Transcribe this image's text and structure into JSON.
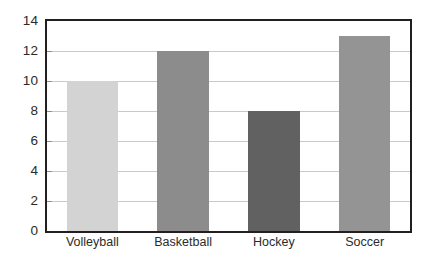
{
  "chart_data": {
    "type": "bar",
    "title": "",
    "subtitle": "",
    "xlabel": "",
    "ylabel": "",
    "categories": [
      "Volleyball",
      "Basketball",
      "Hockey",
      "Soccer"
    ],
    "values": [
      10,
      12,
      8,
      13
    ],
    "bar_colors": [
      "#d3d3d3",
      "#8c8c8c",
      "#616161",
      "#949494"
    ],
    "ylim": [
      0,
      14
    ],
    "ytick_values": [
      0,
      2,
      4,
      6,
      8,
      10,
      12,
      14
    ],
    "ytick_labels": [
      "0",
      "2",
      "4",
      "6",
      "8",
      "10",
      "12",
      "14"
    ],
    "grid": true,
    "grid_axis": "y",
    "grid_color": "#c9c9c9",
    "legend": false,
    "legend_position": "none",
    "frame_color": "#231f20",
    "plot_background": "#ffffff",
    "annotations": []
  }
}
